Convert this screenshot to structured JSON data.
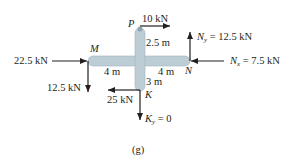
{
  "figure_label": "(g)",
  "colors": {
    "member": "#bccdd6",
    "member_stroke": "#9fb3bd",
    "line": "#231f20"
  },
  "points": {
    "P": "P",
    "M": "M",
    "N": "N",
    "K": "K"
  },
  "forces": {
    "top": "10 kN",
    "left_horizontal": "22.5 kN",
    "left_vertical": "12.5 kN",
    "bottom_horizontal": "25 kN",
    "ny_sym": "N",
    "ny_sub": "y",
    "ny_val": " = 12.5 kN",
    "nx_sym": "N",
    "nx_sub": "x",
    "nx_val": " = 7.5 kN",
    "ky_sym": "K",
    "ky_sub": "y",
    "ky_val": " = 0"
  },
  "dimensions": {
    "mp": "2.5 m",
    "left": "4 m",
    "right": "4 m",
    "down": "3 m"
  }
}
